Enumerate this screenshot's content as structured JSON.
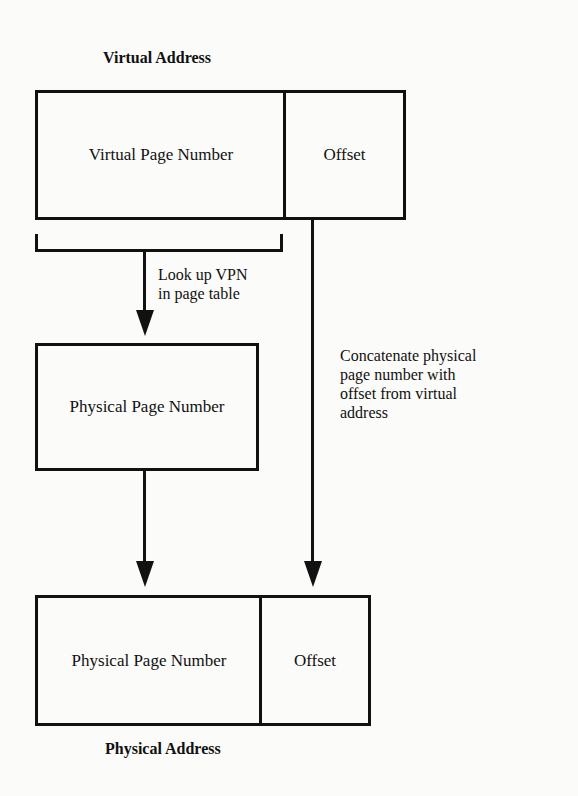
{
  "diagram": {
    "virtual_address": {
      "title": "Virtual Address",
      "fields": [
        {
          "label": "Virtual Page Number"
        },
        {
          "label": "Offset"
        }
      ]
    },
    "lookup_note": {
      "line1": "Look up VPN",
      "line2": "in page table"
    },
    "physical_page_number_box": {
      "label": "Physical Page Number"
    },
    "concatenate_note": {
      "line1": "Concatenate physical",
      "line2": "page number with",
      "line3": "offset from virtual",
      "line4": "address"
    },
    "physical_address": {
      "title": "Physical Address",
      "fields": [
        {
          "label": "Physical Page Number"
        },
        {
          "label": "Offset"
        }
      ]
    },
    "colors": {
      "line": "#111111",
      "background": "#fbfbf9"
    }
  }
}
